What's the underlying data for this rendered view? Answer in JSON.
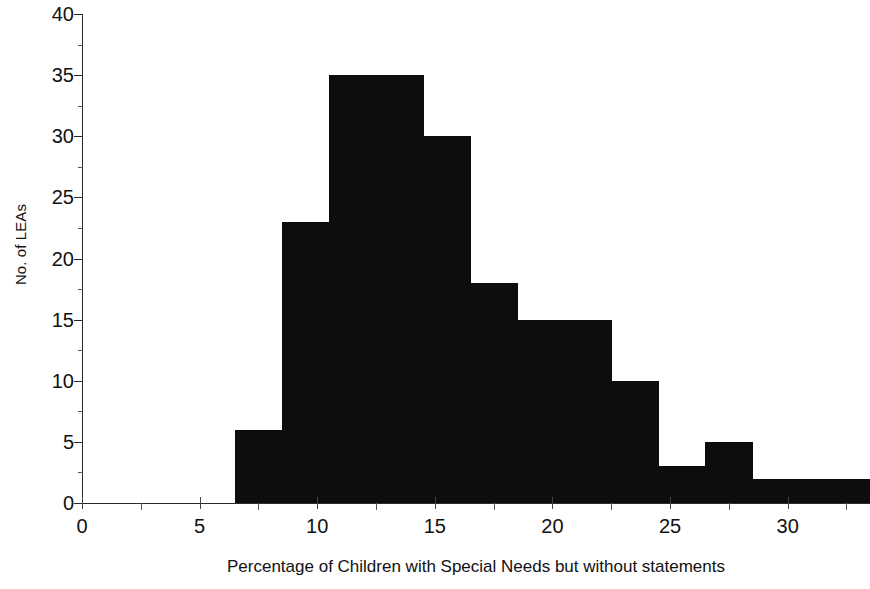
{
  "chart_data": {
    "type": "bar",
    "title": "",
    "subtitle": "",
    "xlabel": "Percentage of Children with Special Needs but without statements",
    "ylabel": "No. of LEAs",
    "xlim": [
      0,
      33.5
    ],
    "ylim": [
      0,
      40
    ],
    "grid": false,
    "legend": null,
    "bar_color": "#0d0d0d",
    "axis_color": "#2a2a2a",
    "x_ticks": [
      0,
      5,
      10,
      15,
      20,
      25,
      30
    ],
    "x_tick_labels": [
      "0",
      "5",
      "10",
      "15",
      "20",
      "25",
      "30"
    ],
    "x_minor_ticks": [
      2.5,
      7.5,
      12.5,
      17.5,
      22.5,
      27.5,
      32.5
    ],
    "y_ticks": [
      0,
      5,
      10,
      15,
      20,
      25,
      30,
      35,
      40
    ],
    "y_tick_labels": [
      "0",
      "5",
      "10",
      "15",
      "20",
      "25",
      "30",
      "35",
      "40"
    ],
    "bin_width": 2,
    "bins": [
      {
        "start": 6.5,
        "end": 8.5,
        "value": 6
      },
      {
        "start": 8.5,
        "end": 10.5,
        "value": 23
      },
      {
        "start": 10.5,
        "end": 12.5,
        "value": 35
      },
      {
        "start": 12.5,
        "end": 14.5,
        "value": 35
      },
      {
        "start": 14.5,
        "end": 16.5,
        "value": 30
      },
      {
        "start": 16.5,
        "end": 18.5,
        "value": 18
      },
      {
        "start": 18.5,
        "end": 20.5,
        "value": 15
      },
      {
        "start": 20.5,
        "end": 22.5,
        "value": 15
      },
      {
        "start": 22.5,
        "end": 24.5,
        "value": 10
      },
      {
        "start": 24.5,
        "end": 26.5,
        "value": 3
      },
      {
        "start": 26.5,
        "end": 28.5,
        "value": 5
      },
      {
        "start": 28.5,
        "end": 30.5,
        "value": 2
      },
      {
        "start": 30.5,
        "end": 33.5,
        "value": 2
      }
    ],
    "categories": [
      "6.5-8.5",
      "8.5-10.5",
      "10.5-12.5",
      "12.5-14.5",
      "14.5-16.5",
      "16.5-18.5",
      "18.5-20.5",
      "20.5-22.5",
      "22.5-24.5",
      "24.5-26.5",
      "26.5-28.5",
      "28.5-30.5",
      "30.5-33.5"
    ],
    "values": [
      6,
      23,
      35,
      35,
      30,
      18,
      15,
      15,
      10,
      3,
      5,
      2,
      2
    ]
  }
}
